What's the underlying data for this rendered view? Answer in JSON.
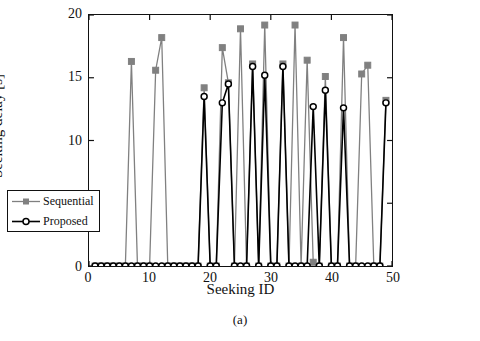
{
  "caption": "(a)",
  "chart_data": {
    "type": "line",
    "title": "",
    "xlabel": "Seeking ID",
    "ylabel": "Seeking delay [s]",
    "xlim": [
      0,
      50
    ],
    "ylim": [
      0,
      20
    ],
    "xticks": [
      0,
      10,
      20,
      30,
      40,
      50
    ],
    "yticks": [
      0,
      5,
      10,
      15,
      20
    ],
    "grid": false,
    "legend_position": "lower-left-outside",
    "colors": {
      "sequential": "#808080",
      "proposed": "#000000",
      "axis": "#111111",
      "background": "#ffffff"
    },
    "x": [
      1,
      2,
      3,
      4,
      5,
      6,
      7,
      8,
      9,
      10,
      11,
      12,
      13,
      14,
      15,
      16,
      17,
      18,
      19,
      20,
      21,
      22,
      23,
      24,
      25,
      26,
      27,
      28,
      29,
      30,
      31,
      32,
      33,
      34,
      35,
      36,
      37,
      38,
      39,
      40,
      41,
      42,
      43,
      44,
      45,
      46,
      47,
      48,
      49
    ],
    "series": [
      {
        "name": "Sequential",
        "marker": "square",
        "values": [
          0,
          0,
          0,
          0,
          0,
          0,
          16.3,
          0,
          0,
          0,
          15.6,
          18.2,
          0,
          0,
          0,
          0,
          0,
          0,
          14.2,
          0,
          0,
          17.4,
          14.6,
          0,
          18.9,
          0,
          16.1,
          0,
          19.2,
          0,
          0,
          16.1,
          0,
          19.2,
          0,
          16.4,
          0.3,
          0,
          15.1,
          0,
          0,
          18.2,
          0,
          0,
          15.3,
          16.0,
          0,
          0,
          13.2
        ]
      },
      {
        "name": "Proposed",
        "marker": "circle",
        "values": [
          0,
          0,
          0,
          0,
          0,
          0,
          0,
          0,
          0,
          0,
          0,
          0,
          0,
          0,
          0,
          0,
          0,
          0,
          13.5,
          0,
          0,
          13.0,
          14.5,
          0,
          0,
          0,
          15.9,
          0,
          15.2,
          0,
          0,
          15.9,
          0,
          0,
          0,
          0,
          12.7,
          0,
          14.0,
          0,
          0,
          12.6,
          0,
          0,
          0,
          0,
          0,
          0,
          13.0
        ]
      }
    ]
  },
  "legend": {
    "items": [
      {
        "label": "Sequential",
        "marker": "square",
        "color": "#808080"
      },
      {
        "label": "Proposed",
        "marker": "circle",
        "color": "#000000"
      }
    ]
  }
}
